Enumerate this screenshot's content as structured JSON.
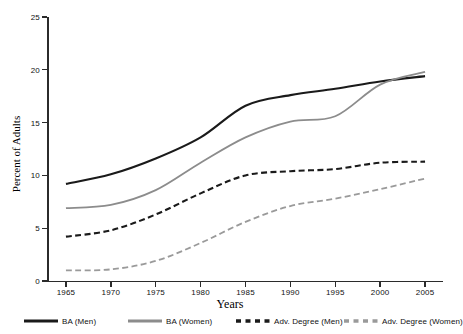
{
  "chart_data": {
    "type": "line",
    "title": "",
    "xlabel": "Years",
    "ylabel": "Percent of Adults",
    "x": [
      1965,
      1970,
      1975,
      1980,
      1985,
      1990,
      1995,
      2000,
      2005
    ],
    "xlim": [
      1963,
      2007
    ],
    "ylim": [
      0,
      25
    ],
    "xticks": [
      "1965",
      "1970",
      "1975",
      "1980",
      "1985",
      "1990",
      "1995",
      "2000",
      "2005"
    ],
    "yticks": [
      "0",
      "5",
      "10",
      "15",
      "20",
      "25"
    ],
    "grid": false,
    "legend_position": "bottom",
    "series": [
      {
        "name": "BA (Men)",
        "style": "solid",
        "color": "#1a1a1a",
        "width": 2.1,
        "values": [
          9.2,
          10.1,
          11.6,
          13.6,
          16.6,
          17.6,
          18.2,
          18.9,
          19.4
        ]
      },
      {
        "name": "BA (Women)",
        "style": "solid",
        "color": "#8c8c8c",
        "width": 1.8,
        "values": [
          6.9,
          7.2,
          8.6,
          11.2,
          13.6,
          15.1,
          15.6,
          18.6,
          19.8
        ]
      },
      {
        "name": "Adv. Degree (Men)",
        "style": "dashed",
        "color": "#1a1a1a",
        "width": 2.1,
        "values": [
          4.2,
          4.8,
          6.3,
          8.3,
          10.0,
          10.4,
          10.6,
          11.2,
          11.3
        ]
      },
      {
        "name": "Adv. Degree (Women)",
        "style": "dashed",
        "color": "#9a9a9a",
        "width": 1.8,
        "values": [
          1.0,
          1.1,
          1.9,
          3.6,
          5.6,
          7.1,
          7.8,
          8.7,
          9.7
        ]
      }
    ]
  },
  "legend": {
    "items": [
      {
        "label": "BA (Men)"
      },
      {
        "label": "BA (Women)"
      },
      {
        "label": "Adv. Degree (Men)"
      },
      {
        "label": "Adv. Degree (Women)"
      }
    ]
  }
}
